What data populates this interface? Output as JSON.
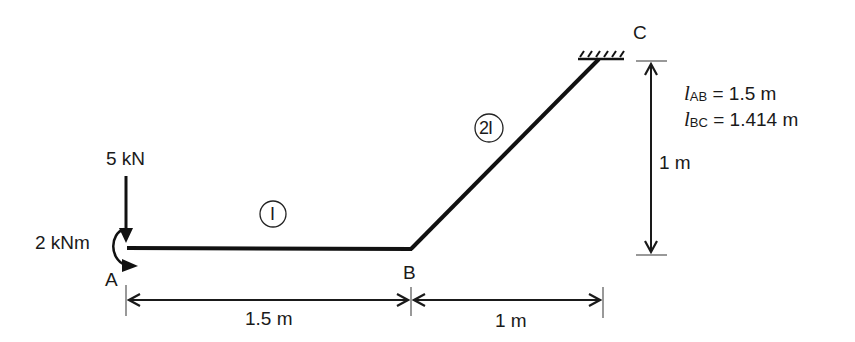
{
  "diagram": {
    "type": "structural-frame",
    "nodes": {
      "A": {
        "label": "A"
      },
      "B": {
        "label": "B"
      },
      "C": {
        "label": "C"
      }
    },
    "members": [
      {
        "id": "AB",
        "stiffness_label": "I"
      },
      {
        "id": "BC",
        "stiffness_label": "2I"
      }
    ],
    "loads": {
      "point_load": "5 kN",
      "moment": "2 kNm"
    },
    "dimensions": {
      "ab_horizontal": "1.5 m",
      "bc_horizontal": "1 m",
      "bc_vertical": "1 m"
    },
    "lengths": {
      "ab": {
        "symbol": "l",
        "sub": "AB",
        "value": "= 1.5 m"
      },
      "bc": {
        "symbol": "l",
        "sub": "BC",
        "value": "= 1.414 m"
      }
    },
    "support_C": "fixed"
  }
}
